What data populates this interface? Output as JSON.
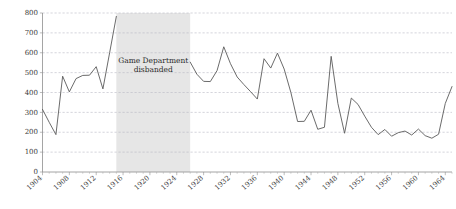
{
  "chart_data": {
    "type": "line",
    "title": "",
    "subtitle": "",
    "xlabel": "",
    "ylabel": "",
    "xlim": [
      1904,
      1965
    ],
    "ylim": [
      0,
      800
    ],
    "grid": true,
    "legend": false,
    "legend_position": "none",
    "y_ticks": [
      0,
      100,
      200,
      300,
      400,
      500,
      600,
      700,
      800
    ],
    "y_tick_labels": [
      "0",
      "100",
      "200",
      "300",
      "400",
      "500",
      "600",
      "700",
      "800"
    ],
    "x_ticks": [
      1904,
      1908,
      1912,
      1916,
      1920,
      1924,
      1928,
      1932,
      1936,
      1940,
      1944,
      1948,
      1952,
      1956,
      1960,
      1964
    ],
    "x_tick_labels": [
      "1904",
      "1908",
      "1912",
      "1916",
      "1920",
      "1924",
      "1928",
      "1932",
      "1936",
      "1940",
      "1944",
      "1948",
      "1952",
      "1956",
      "1960",
      "1964"
    ],
    "line_color": "#5a5a5a",
    "band_color": "#e6e6e6",
    "grid_color": "#b9b9c4",
    "axis_color": "#8e8e8e",
    "annotations": [
      {
        "name": "game-department-disbanded",
        "line1": "Game Department",
        "line2": "disbanded",
        "x_start": 1915,
        "x_end": 1926
      }
    ],
    "series": [
      {
        "name": "series-1",
        "x": [
          1904,
          1905,
          1906,
          1907,
          1908,
          1909,
          1910,
          1911,
          1912,
          1913,
          1914,
          1915,
          1926,
          1927,
          1928,
          1929,
          1930,
          1931,
          1932,
          1933,
          1934,
          1935,
          1936,
          1937,
          1938,
          1939,
          1940,
          1941,
          1942,
          1943,
          1944,
          1945,
          1946,
          1947,
          1948,
          1949,
          1950,
          1951,
          1952,
          1953,
          1954,
          1955,
          1956,
          1957,
          1958,
          1959,
          1960,
          1961,
          1962,
          1963,
          1964,
          1965
        ],
        "values": [
          315,
          250,
          188,
          482,
          403,
          470,
          486,
          487,
          530,
          418,
          600,
          783,
          553,
          492,
          456,
          455,
          510,
          630,
          545,
          478,
          440,
          404,
          367,
          570,
          523,
          598,
          518,
          400,
          254,
          255,
          311,
          215,
          225,
          582,
          345,
          195,
          372,
          340,
          281,
          225,
          188,
          214,
          180,
          198,
          206,
          186,
          216,
          183,
          170,
          190,
          345,
          430
        ]
      }
    ]
  }
}
